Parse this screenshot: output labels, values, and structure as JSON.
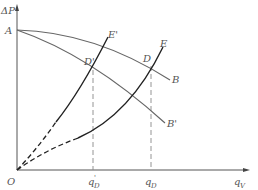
{
  "diagram": {
    "axes": {
      "y_label": "ΔP",
      "x_label_main": "q",
      "x_label_sub": "V",
      "origin_label": "O"
    },
    "points": {
      "A": "A",
      "B": "B",
      "B_prime": "B'",
      "D": "D",
      "D_prime": "D'",
      "E": "E",
      "E_prime": "E'"
    },
    "x_ticks": [
      {
        "main": "q",
        "sub": "D",
        "prime": "'"
      },
      {
        "main": "q",
        "sub": "D",
        "prime": ""
      }
    ],
    "colors": {
      "axis": "#555555",
      "fan_curve": "#666666",
      "system_curve": "#222222",
      "guide": "#888888"
    }
  }
}
